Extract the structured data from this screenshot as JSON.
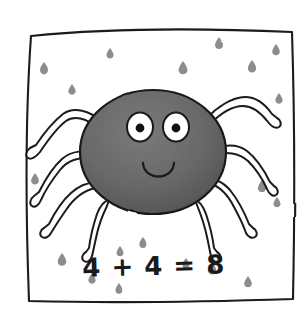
{
  "illustration": {
    "title": "Smiling spider with addition equation",
    "style": "hand-drawn children's book illustration",
    "frame": {
      "name": "hand-drawn-square-border",
      "stroke_color": "#1a1a1a",
      "fill_color": "#ffffff"
    },
    "spider": {
      "name": "cartoon-spider",
      "body_color": "#6e6e6e",
      "body_outline_color": "#1a1a1a",
      "leg_fill_color": "#ffffff",
      "leg_outline_color": "#1a1a1a",
      "leg_count": 8,
      "eye_fill_color": "#ffffff",
      "pupil_color": "#111111",
      "mouth_color": "#1a1a1a",
      "expression": "smiling"
    },
    "caption": {
      "equation": "4 + 4 = 8",
      "color": "#1a1a1a"
    },
    "speckles": {
      "name": "background-speckles",
      "color": "#8a8a8a",
      "count": 19,
      "shape": "teardrop"
    }
  }
}
